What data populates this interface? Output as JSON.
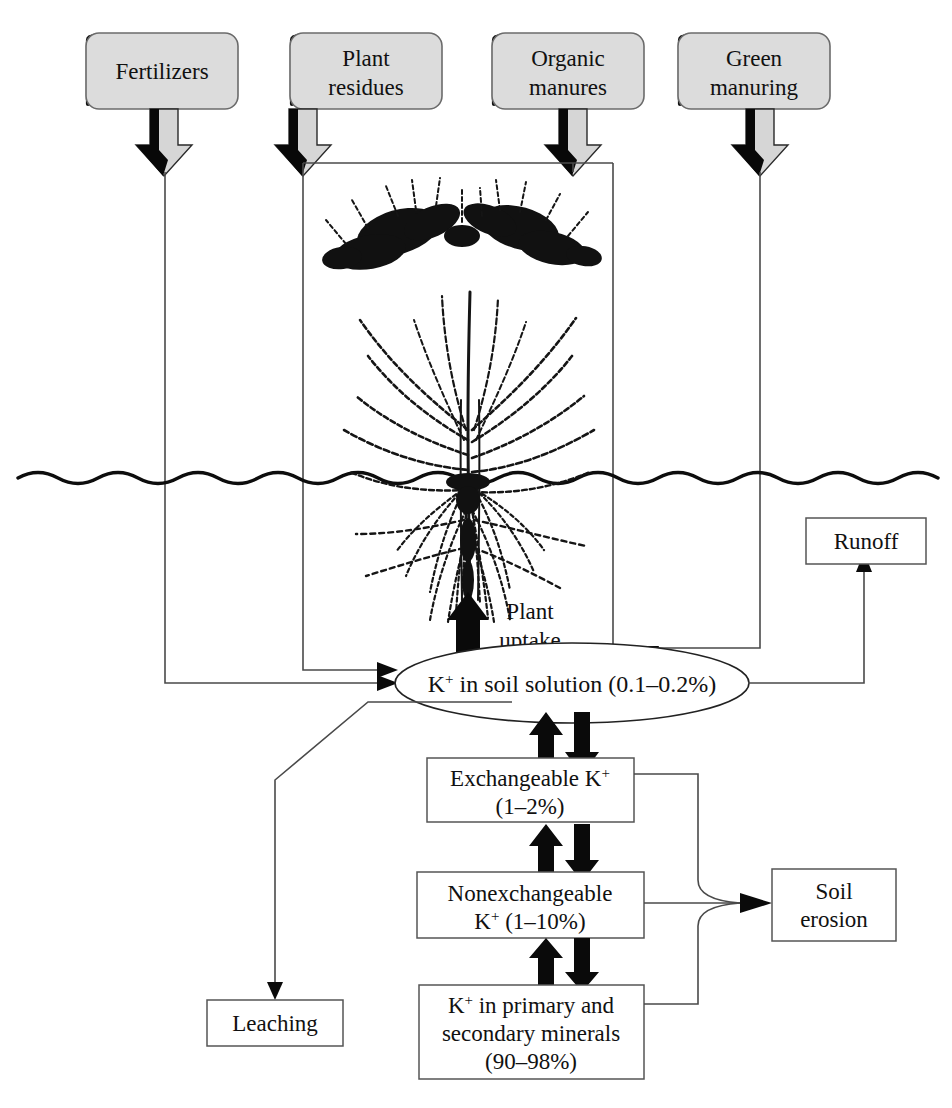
{
  "figure": {
    "soil_line_label": "soil-surface"
  },
  "sources": [
    {
      "id": "fertilizers",
      "label": "Fertilizers",
      "lines": [
        "Fertilizers"
      ]
    },
    {
      "id": "plant-residues",
      "label": "Plant residues",
      "lines": [
        "Plant",
        "residues"
      ]
    },
    {
      "id": "organic-manures",
      "label": "Organic manures",
      "lines": [
        "Organic",
        "manures"
      ]
    },
    {
      "id": "green-manuring",
      "label": "Green manuring",
      "lines": [
        "Green",
        "manuring"
      ]
    }
  ],
  "pools": {
    "soil_solution": {
      "label": "K+ in soil solution (0.1-0.2%)",
      "prefix": "K",
      "sup": "+",
      "rest": " in soil solution (0.1–0.2%)",
      "percent": "0.1–0.2%"
    },
    "exchangeable": {
      "line1_prefix": "Exchangeable K",
      "line1_sup": "+",
      "line2": "(1–2%)",
      "percent": "1–2%"
    },
    "nonexchangeable": {
      "line1": "Nonexchangeable",
      "line2_prefix": "K",
      "line2_sup": "+",
      "line2_rest": " (1–10%)",
      "percent": "1–10%"
    },
    "minerals": {
      "line1_prefix": "K",
      "line1_sup": "+",
      "line1_rest": " in primary and",
      "line2": "secondary minerals",
      "line3": "(90–98%)",
      "percent": "90–98%"
    }
  },
  "outputs": [
    {
      "id": "runoff",
      "label": "Runoff",
      "lines": [
        "Runoff"
      ]
    },
    {
      "id": "soil-erosion",
      "label": "Soil erosion",
      "lines": [
        "Soil",
        "erosion"
      ]
    },
    {
      "id": "leaching",
      "label": "Leaching",
      "lines": [
        "Leaching"
      ]
    }
  ],
  "process_labels": {
    "plant_uptake_line1": "Plant",
    "plant_uptake_line2": "uptake"
  },
  "colors": {
    "source_box_fill": "#dcdcdc",
    "source_box_stroke": "#6b6b6b",
    "box_stroke": "#555555",
    "ink": "#111111",
    "connector": "#4a4a4a",
    "page_background": "#ffffff"
  }
}
